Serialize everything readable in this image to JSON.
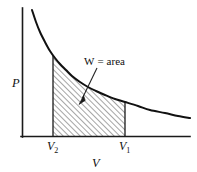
{
  "figure": {
    "background_color": "#ffffff",
    "line_color": "#111111"
  },
  "axes": {
    "y_label": "P",
    "x_label": "V",
    "y_axis_name": "pressure-axis",
    "x_axis_name": "volume-axis"
  },
  "annotation": {
    "symbol": "W",
    "equals": "=",
    "word": "area",
    "full_text": "W = area"
  },
  "ticks": {
    "left": {
      "base": "V",
      "sub": "2",
      "full": "V2"
    },
    "right": {
      "base": "V",
      "sub": "1",
      "full": "V1"
    }
  },
  "chart_data": {
    "type": "line",
    "title": "",
    "xlabel": "V",
    "ylabel": "P",
    "grid": false,
    "legend": null,
    "axis_origin": {
      "x": 22,
      "y": 136
    },
    "axis_extent": {
      "x_max": 190,
      "y_min": 8
    },
    "curve": {
      "name": "isotherm",
      "description": "hyperbolic decreasing pressure-volume curve, P proportional to 1/V",
      "x_start": 32,
      "x_end": 190,
      "points": [
        [
          32,
          10
        ],
        [
          36,
          22
        ],
        [
          40,
          32
        ],
        [
          45,
          42
        ],
        [
          50,
          51
        ],
        [
          55,
          58
        ],
        [
          60,
          64
        ],
        [
          66,
          70
        ],
        [
          72,
          76
        ],
        [
          80,
          82
        ],
        [
          88,
          87
        ],
        [
          96,
          91
        ],
        [
          105,
          95
        ],
        [
          115,
          99
        ],
        [
          125,
          102
        ],
        [
          138,
          106
        ],
        [
          150,
          110
        ],
        [
          165,
          113
        ],
        [
          178,
          116
        ],
        [
          190,
          118
        ]
      ]
    },
    "shaded_region": {
      "name": "work-area",
      "fill_pattern": "diagonal-hatch-45",
      "x_left": 53,
      "x_right": 125,
      "y_bottom": 136,
      "label": "W = area",
      "hatch_spacing_px": 4,
      "hatch_angle_deg": 45
    },
    "tick_labels": [
      {
        "x": 53,
        "text": "V2",
        "position": "below-axis"
      },
      {
        "x": 125,
        "text": "V1",
        "position": "below-axis"
      }
    ],
    "pointer": {
      "from": [
        97,
        68
      ],
      "to": [
        80,
        103
      ],
      "style": "arrow"
    }
  }
}
